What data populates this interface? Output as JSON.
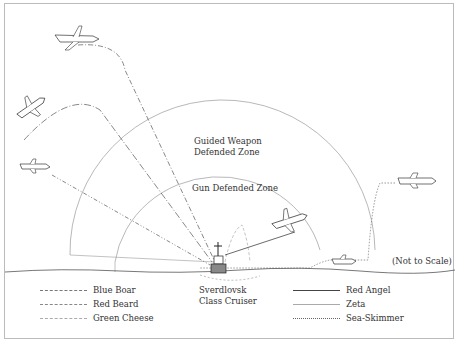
{
  "diagram": {
    "zones": {
      "guided_weapon": [
        "Guided Weapon",
        "Defended Zone"
      ],
      "gun": "Gun Defended Zone"
    },
    "ship_label": [
      "Sverdlovsk",
      "Class Cruiser"
    ],
    "scale_note": "(Not to Scale)"
  },
  "legend": {
    "left": [
      {
        "label": "Blue Boar",
        "style": "dash-dot"
      },
      {
        "label": "Red Beard",
        "style": "long-dash-dot"
      },
      {
        "label": "Green Cheese",
        "style": "dash-dot-dot"
      }
    ],
    "right": [
      {
        "label": "Red Angel",
        "style": "solid-dark"
      },
      {
        "label": "Zeta",
        "style": "solid-light"
      },
      {
        "label": "Sea-Skimmer",
        "style": "dotted"
      }
    ]
  },
  "colors": {
    "line_dark": "#444444",
    "line_light": "#999999",
    "frame": "#bbbbbb"
  }
}
